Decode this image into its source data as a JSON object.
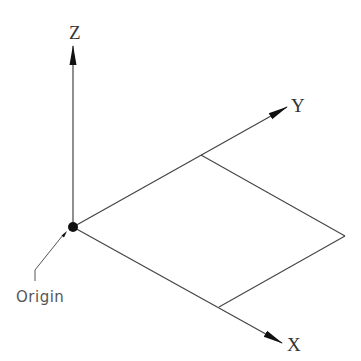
{
  "diagram": {
    "type": "3d-coordinate-axes",
    "colors": {
      "line": "#444444",
      "text": "#333333",
      "origin_text": "#555555",
      "background": "#ffffff"
    },
    "origin": {
      "label": "Origin",
      "point": [
        73,
        227
      ]
    },
    "axes": [
      {
        "name": "Z",
        "label": "Z",
        "tip": [
          73,
          45
        ]
      },
      {
        "name": "Y",
        "label": "Y",
        "tip": [
          287,
          107
        ]
      },
      {
        "name": "X",
        "label": "X",
        "tip": [
          281,
          343
        ]
      }
    ],
    "plane": {
      "description": "XY plane parallelogram",
      "vertices": [
        [
          73,
          227
        ],
        [
          201,
          155
        ],
        [
          345,
          236
        ],
        [
          219,
          307
        ]
      ]
    }
  }
}
